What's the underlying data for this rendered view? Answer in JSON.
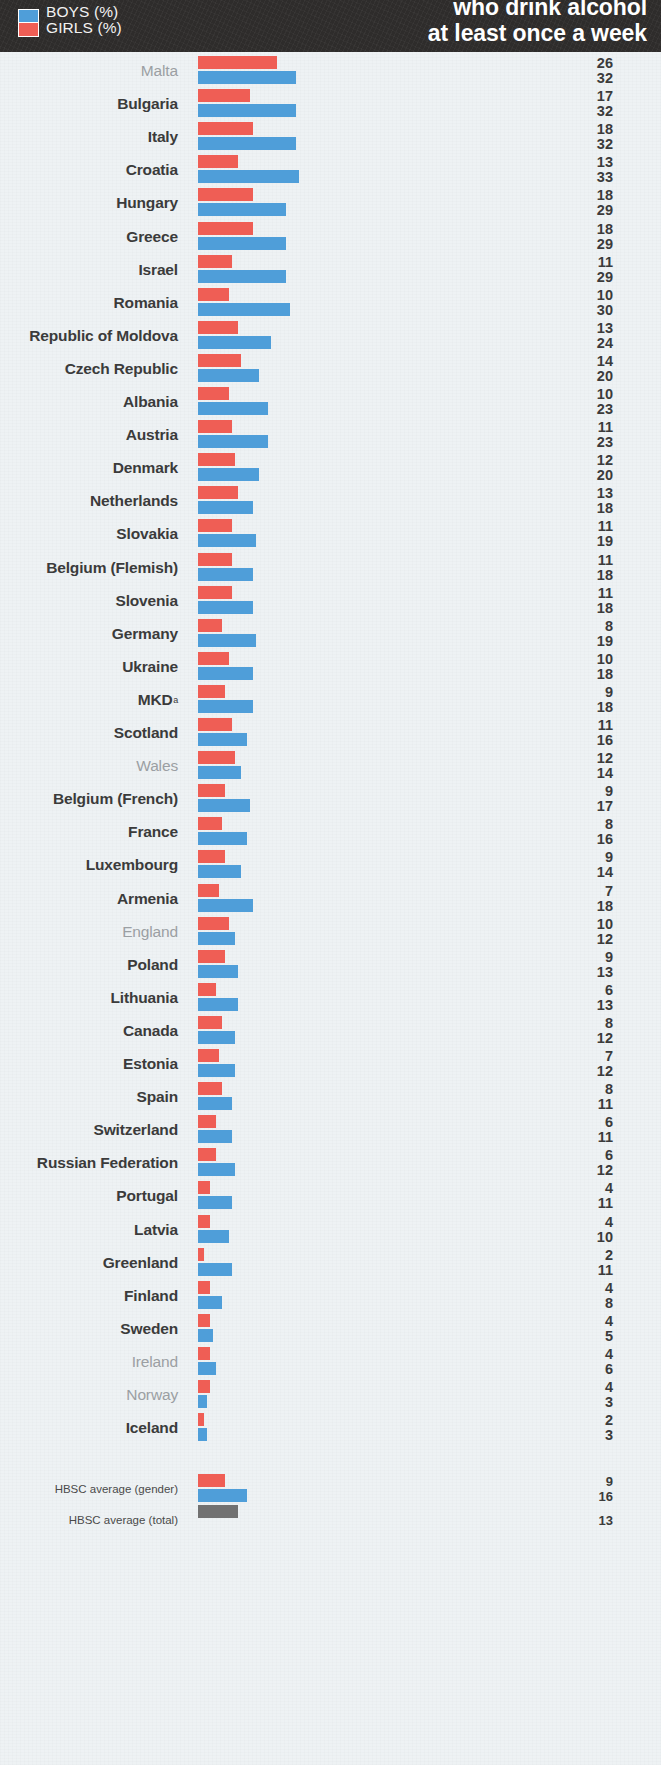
{
  "header": {
    "title_line1": "who drink alcohol",
    "title_line2": "at least once a week",
    "legend": [
      {
        "key": "boys",
        "label": "BOYS (%)",
        "color": "#4f9ed9"
      },
      {
        "key": "girls",
        "label": "GIRLS (%)",
        "color": "#ef5e55"
      }
    ]
  },
  "colors": {
    "boys": "#4f9ed9",
    "girls": "#ef5e55",
    "total": "#717171",
    "header_band": "#2e2c2b",
    "background": "#eef2f4",
    "label_text": "#3b3b3b",
    "label_text_dim": "#9b9fa3"
  },
  "footnote_marker": "a",
  "chart_data": {
    "type": "bar",
    "title": "who drink alcohol at least once a week",
    "xlabel": "",
    "ylabel": "",
    "xlim": [
      0,
      33
    ],
    "grid": false,
    "legend_position": "top-left",
    "orientation": "horizontal",
    "categories": [
      "Malta",
      "Bulgaria",
      "Italy",
      "Croatia",
      "Hungary",
      "Greece",
      "Israel",
      "Romania",
      "Republic of Moldova",
      "Czech Republic",
      "Albania",
      "Austria",
      "Denmark",
      "Netherlands",
      "Slovakia",
      "Belgium (Flemish)",
      "Slovenia",
      "Germany",
      "Ukraine",
      "MKD",
      "Scotland",
      "Wales",
      "Belgium (French)",
      "France",
      "Luxembourg",
      "Armenia",
      "England",
      "Poland",
      "Lithuania",
      "Canada",
      "Estonia",
      "Spain",
      "Switzerland",
      "Russian Federation",
      "Portugal",
      "Latvia",
      "Greenland",
      "Finland",
      "Sweden",
      "Ireland",
      "Norway",
      "Iceland"
    ],
    "series": [
      {
        "name": "GIRLS (%)",
        "color": "#ef5e55",
        "values": [
          26,
          17,
          18,
          13,
          18,
          18,
          11,
          10,
          13,
          14,
          10,
          11,
          12,
          13,
          11,
          11,
          11,
          8,
          10,
          9,
          11,
          12,
          9,
          8,
          9,
          7,
          10,
          9,
          6,
          8,
          7,
          8,
          6,
          6,
          4,
          4,
          2,
          4,
          4,
          4,
          4,
          2
        ]
      },
      {
        "name": "BOYS (%)",
        "color": "#4f9ed9",
        "values": [
          32,
          32,
          32,
          33,
          29,
          29,
          29,
          30,
          24,
          20,
          23,
          23,
          20,
          18,
          19,
          18,
          18,
          19,
          18,
          18,
          16,
          14,
          17,
          16,
          14,
          18,
          12,
          13,
          13,
          12,
          12,
          11,
          11,
          12,
          11,
          10,
          11,
          8,
          5,
          6,
          3,
          3
        ]
      }
    ],
    "dim_categories": [
      "Malta",
      "Wales",
      "England",
      "Ireland",
      "Norway"
    ],
    "footnote_categories": [
      "MKD"
    ],
    "averages": [
      {
        "label": "HBSC average (gender)",
        "girls": 9,
        "boys": 16
      },
      {
        "label": "HBSC average (total)",
        "total": 13
      }
    ]
  }
}
